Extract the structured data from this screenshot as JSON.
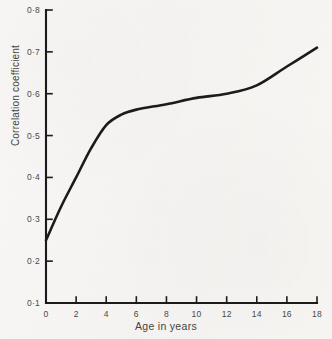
{
  "figure": {
    "background_color": "#f7f6f4",
    "ink_color": "#1b1b1b",
    "text_color": "#46443f"
  },
  "chart_data": {
    "type": "line",
    "title": "",
    "subtitle": "",
    "xlabel": "Age in years",
    "ylabel": "Correlation coefficient",
    "xlim": [
      0,
      18
    ],
    "ylim": [
      0.1,
      0.8
    ],
    "grid": false,
    "legend": null,
    "legend_position": "none",
    "x_ticks": [
      0,
      2,
      4,
      6,
      8,
      10,
      12,
      14,
      16,
      18
    ],
    "x_tick_labels": [
      "0",
      "2",
      "4",
      "6",
      "8",
      "10",
      "12",
      "14",
      "16",
      "18"
    ],
    "y_ticks": [
      0.1,
      0.2,
      0.3,
      0.4,
      0.5,
      0.6,
      0.7,
      0.8
    ],
    "y_tick_labels": [
      "0·1",
      "0·2",
      "0·3",
      "0·4",
      "0·5",
      "0·6",
      "0·7",
      "0·8"
    ],
    "series": [
      {
        "name": "Correlation coefficient by age",
        "x": [
          0,
          1,
          2,
          3,
          4,
          5,
          6,
          8,
          10,
          12,
          14,
          16,
          18
        ],
        "values": [
          0.25,
          0.33,
          0.4,
          0.47,
          0.525,
          0.55,
          0.562,
          0.575,
          0.59,
          0.6,
          0.62,
          0.665,
          0.71
        ],
        "color": "#1b1b1b",
        "line_width": 2.6,
        "marker": "none"
      }
    ],
    "annotations": []
  }
}
